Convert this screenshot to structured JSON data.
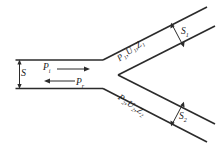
{
  "diagram": {
    "name": "bifurcated-duct-acoustic-diagram",
    "stroke_color": "#2b2b2b",
    "background_color": "#ffffff",
    "labels": {
      "main_duct_width": "S",
      "incident_pressure": "P",
      "incident_pressure_sub": "i",
      "reflected_pressure": "P",
      "reflected_pressure_sub": "r",
      "branch1_quantities": "P₁,U₁,Z₁",
      "branch2_quantities": "P₂,U₂,Z₂",
      "branch1_area": "S",
      "branch1_area_sub": "1",
      "branch2_area": "S",
      "branch2_area_sub": "2"
    },
    "arrows": {
      "incident_direction": "right",
      "reflected_direction": "left",
      "main_width_direction": "double-vertical",
      "branch1_width_direction": "double",
      "branch2_width_direction": "double"
    }
  }
}
